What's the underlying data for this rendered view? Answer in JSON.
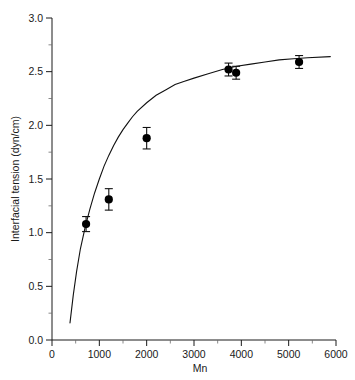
{
  "chart_data": {
    "type": "scatter",
    "title": "",
    "xlabel": "Mn",
    "ylabel": "Interfacial tension (dyn/cm)",
    "xlim": [
      0,
      6000
    ],
    "ylim": [
      0.0,
      3.0
    ],
    "grid": false,
    "legend": "none",
    "x_ticks": [
      0,
      1000,
      2000,
      3000,
      4000,
      5000,
      6000
    ],
    "x_tick_labels": [
      "0",
      "1000",
      "2000",
      "3000",
      "4000",
      "5000",
      "6000"
    ],
    "x_minor_ticks": [
      500,
      1500,
      2500,
      3500,
      4500,
      5500
    ],
    "y_ticks": [
      0.0,
      0.5,
      1.0,
      1.5,
      2.0,
      2.5,
      3.0
    ],
    "y_tick_labels": [
      "0.0",
      "0.5",
      "1.0",
      "1.5",
      "2.0",
      "2.5",
      "3.0"
    ],
    "y_minor_ticks": [
      0.25,
      0.75,
      1.25,
      1.75,
      2.25,
      2.75
    ],
    "marker_style": "filled-circle",
    "marker_color": "#000000",
    "curve_color": "#111111",
    "series": [
      {
        "name": "Interfacial tension vs Mn",
        "x": [
          720,
          1200,
          2000,
          3730,
          3890,
          5220
        ],
        "y": [
          1.08,
          1.31,
          1.88,
          2.52,
          2.49,
          2.59
        ],
        "yerr": [
          0.07,
          0.1,
          0.1,
          0.06,
          0.06,
          0.06
        ]
      }
    ],
    "fit_curve": {
      "name": "fitted saturation curve",
      "x": [
        380,
        450,
        520,
        600,
        700,
        800,
        900,
        1000,
        1100,
        1200,
        1300,
        1400,
        1500,
        1600,
        1700,
        1800,
        2000,
        2200,
        2400,
        2600,
        2800,
        3000,
        3300,
        3600,
        3900,
        4200,
        4500,
        4800,
        5100,
        5400,
        5880
      ],
      "y": [
        0.16,
        0.42,
        0.64,
        0.85,
        1.05,
        1.22,
        1.37,
        1.5,
        1.62,
        1.72,
        1.81,
        1.89,
        1.96,
        2.02,
        2.08,
        2.13,
        2.21,
        2.28,
        2.33,
        2.38,
        2.41,
        2.44,
        2.48,
        2.52,
        2.55,
        2.57,
        2.59,
        2.61,
        2.62,
        2.63,
        2.64
      ]
    }
  }
}
